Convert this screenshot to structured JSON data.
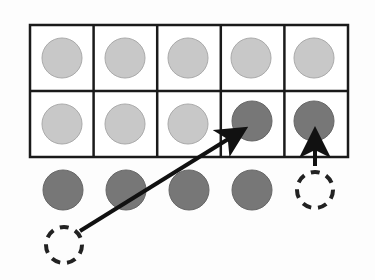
{
  "diagram": {
    "type": "ten-frame",
    "rows": 2,
    "cols": 5,
    "colors": {
      "light_counter": "#c8c8c8",
      "light_counter_border": "#aaaaaa",
      "dark_counter": "#777777",
      "dark_counter_border": "#666666",
      "grid_line": "#1a1a1a",
      "arrow": "#111111",
      "background": "#fdfdfd"
    },
    "frame_cells": [
      [
        "light",
        "light",
        "light",
        "light",
        "light"
      ],
      [
        "light",
        "light",
        "light",
        "dark",
        "dark"
      ]
    ],
    "outside_counters": [
      "dark",
      "dark",
      "dark",
      "dark",
      "empty-dashed"
    ],
    "extra_empty_dashed": 1,
    "arrows": [
      {
        "from": "dashed-bottom-left",
        "to": "row2-col4"
      },
      {
        "from": "dashed-row3-col5",
        "to": "row2-col5"
      }
    ]
  }
}
